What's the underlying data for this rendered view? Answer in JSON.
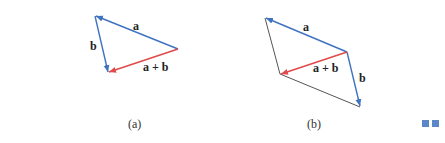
{
  "diagram": {
    "colors": {
      "vector_a": "#3f73c0",
      "vector_b": "#3f73c0",
      "sum": "#e04a4a",
      "construction": "#555555"
    },
    "panel_a": {
      "caption": "(a)",
      "label_a": "a",
      "label_b": "b",
      "label_sum": "a + b"
    },
    "panel_b": {
      "caption": "(b)",
      "label_a": "a",
      "label_b": "b",
      "label_sum": "a + b"
    },
    "decorations": [
      "blue-square",
      "blue-square"
    ]
  }
}
